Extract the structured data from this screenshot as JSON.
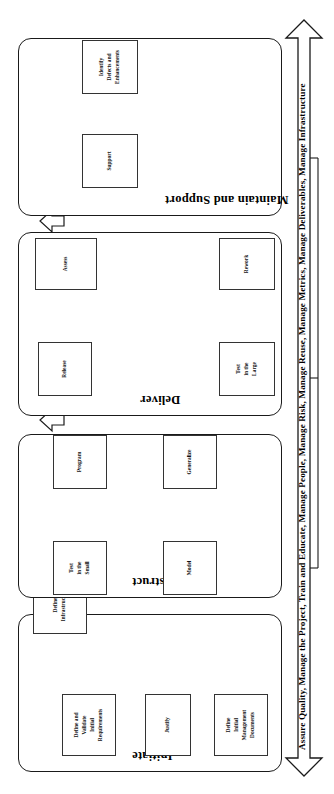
{
  "diagram": {
    "orientation": "rotated-90",
    "phases": [
      {
        "id": "initiate",
        "label": "Initiate",
        "activities": [
          {
            "id": "justify",
            "label": "Justify"
          },
          {
            "id": "define-initial-management-documents",
            "label": "Define\nInitial\nManagement\nDocuments"
          },
          {
            "id": "define-and-validate-initial-requirements",
            "label": "Define and\nValidate\nInitial\nRequirements"
          },
          {
            "id": "define-infrastructure",
            "label": "Define\nInfrastructure"
          }
        ]
      },
      {
        "id": "construct",
        "label": "Construct",
        "activities": [
          {
            "id": "model",
            "label": "Model"
          },
          {
            "id": "generalize",
            "label": "Generalize"
          },
          {
            "id": "test-in-the-small",
            "label": "Test\nin the\nSmall"
          },
          {
            "id": "program",
            "label": "Program"
          }
        ]
      },
      {
        "id": "deliver",
        "label": "Deliver",
        "activities": [
          {
            "id": "test-in-the-large",
            "label": "Test\nin the\nLarge"
          },
          {
            "id": "rework",
            "label": "Rework"
          },
          {
            "id": "release",
            "label": "Release"
          },
          {
            "id": "assess",
            "label": "Assess"
          }
        ]
      },
      {
        "id": "maintain-and-support",
        "label": "Maintain and Support",
        "activities": [
          {
            "id": "support",
            "label": "Support"
          },
          {
            "id": "identify-defects-and-enhancements",
            "label": "Identify\nDefects and\nEnhancements"
          }
        ]
      }
    ],
    "support_arrow": {
      "label": "Assure Quality,  Manage the Project, Train and Educate, Manage People, Manage Risk, Manage Reuse, Manage Metrics, Manage Deliverables, Manage Infrastructure",
      "style": "double-headed-outline-arrow"
    },
    "phase_transitions": [
      {
        "from": "initiate",
        "to": "construct",
        "style": "block-arrow"
      },
      {
        "from": "construct",
        "to": "deliver",
        "style": "block-arrow"
      },
      {
        "from": "deliver",
        "to": "maintain-and-support",
        "style": "block-arrow"
      }
    ],
    "feedback_loops": [
      {
        "from": "maintain-and-support",
        "to": "construct",
        "style": "line-arrow"
      },
      {
        "from": "maintain-and-support",
        "to": "initiate",
        "style": "line-arrow"
      }
    ],
    "colors": {
      "stroke": "#1a1a1a",
      "box_stroke": "#333333",
      "background": "#ffffff",
      "text": "#000000"
    }
  }
}
